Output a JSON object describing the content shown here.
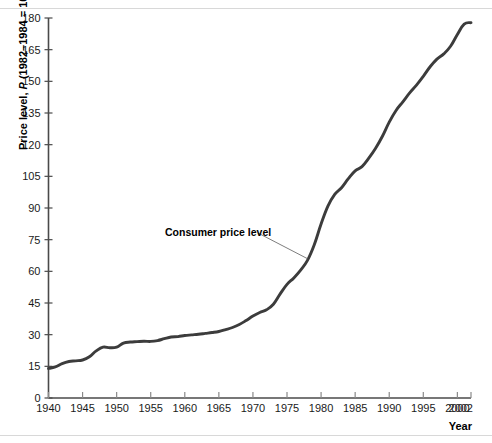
{
  "figure": {
    "background_color": "#ffffff",
    "line_color": "#3c3c3c",
    "axis_color": "#4a4a4a",
    "text_color": "#1a1a1a",
    "rule_color": "#d8d8d8"
  },
  "axis_titles": {
    "y_prefix": "Price level, ",
    "y_italic": "P",
    "y_suffix": " (1982–1984 = 100)",
    "x": "Year"
  },
  "annotation": {
    "label": "Consumer price level"
  },
  "chart_data": {
    "type": "line",
    "title": "",
    "xlabel": "Year",
    "ylabel": "Price level, P (1982–1984 = 100)",
    "xlim": [
      1940,
      2002
    ],
    "ylim": [
      0,
      180
    ],
    "grid": false,
    "legend": "none",
    "annotations": [
      {
        "text": "Consumer price level",
        "points_to_year": 1978,
        "points_to_value": 66
      }
    ],
    "y_ticks": [
      0,
      15,
      30,
      45,
      60,
      75,
      90,
      105,
      120,
      135,
      150,
      165,
      180
    ],
    "x_ticks": [
      1940,
      1945,
      1950,
      1955,
      1960,
      1965,
      1970,
      1975,
      1980,
      1985,
      1990,
      1995,
      2000,
      2002
    ],
    "x_tick_labels": [
      "1940",
      "1945",
      "1950",
      "1955",
      "1960",
      "1965",
      "1970",
      "1975",
      "1980",
      "1985",
      "1990",
      "1995",
      "2000",
      "2002"
    ],
    "series": [
      {
        "name": "Consumer price level",
        "x": [
          1940,
          1941,
          1942,
          1943,
          1944,
          1945,
          1946,
          1947,
          1948,
          1949,
          1950,
          1951,
          1952,
          1953,
          1954,
          1955,
          1956,
          1957,
          1958,
          1959,
          1960,
          1961,
          1962,
          1963,
          1964,
          1965,
          1966,
          1967,
          1968,
          1969,
          1970,
          1971,
          1972,
          1973,
          1974,
          1975,
          1976,
          1977,
          1978,
          1979,
          1980,
          1981,
          1982,
          1983,
          1984,
          1985,
          1986,
          1987,
          1988,
          1989,
          1990,
          1991,
          1992,
          1993,
          1994,
          1995,
          1996,
          1997,
          1998,
          1999,
          2000,
          2001,
          2002
        ],
        "values": [
          14.0,
          14.7,
          16.3,
          17.3,
          17.6,
          18.0,
          19.5,
          22.3,
          24.1,
          23.8,
          24.1,
          26.0,
          26.5,
          26.7,
          26.9,
          26.8,
          27.2,
          28.1,
          28.9,
          29.1,
          29.6,
          29.9,
          30.2,
          30.6,
          31.0,
          31.5,
          32.4,
          33.4,
          34.8,
          36.7,
          38.8,
          40.5,
          41.8,
          44.4,
          49.3,
          53.8,
          56.9,
          60.6,
          65.2,
          72.6,
          82.4,
          90.9,
          96.5,
          99.6,
          103.9,
          107.6,
          109.6,
          113.6,
          118.3,
          124.0,
          130.7,
          136.2,
          140.3,
          144.5,
          148.2,
          152.4,
          156.9,
          160.5,
          163.0,
          166.6,
          172.2,
          177.1,
          177.8
        ]
      }
    ]
  }
}
